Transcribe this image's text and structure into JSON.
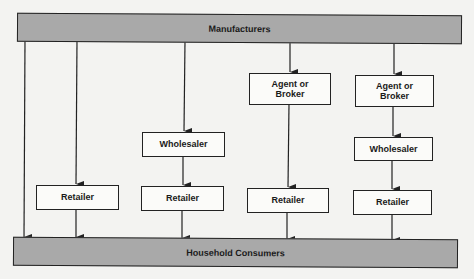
{
  "diagram": {
    "type": "flow",
    "top": {
      "label": "Manufacturers"
    },
    "bottom": {
      "label": "Household Consumers"
    },
    "channels": [
      {
        "path": []
      },
      {
        "path": [
          "Retailer"
        ]
      },
      {
        "path": [
          "Wholesaler",
          "Retailer"
        ]
      },
      {
        "path": [
          "Agent or\nBroker",
          "Retailer"
        ]
      },
      {
        "path": [
          "Agent or\nBroker",
          "Wholesaler",
          "Retailer"
        ]
      }
    ]
  },
  "labels": {
    "manufacturers": "Manufacturers",
    "consumers": "Household Consumers",
    "c2_retailer": "Retailer",
    "c3_wholesaler": "Wholesaler",
    "c3_retailer": "Retailer",
    "c4_agent": "Agent or\nBroker",
    "c4_retailer": "Retailer",
    "c5_agent": "Agent or\nBroker",
    "c5_wholesaler": "Wholesaler",
    "c5_retailer": "Retailer"
  },
  "colors": {
    "bar_fill": "#a9a9a9",
    "box_fill": "#fbfbf9",
    "line": "#222222"
  }
}
